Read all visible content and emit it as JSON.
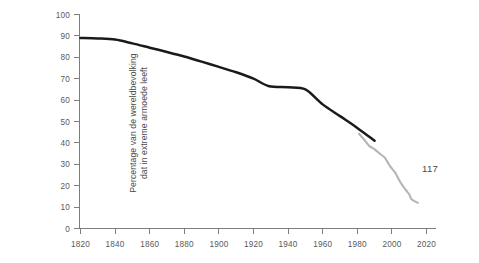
{
  "page": {
    "page_number": "117",
    "background_color": "#ffffff"
  },
  "axis_title": {
    "y_line1": "Percentage van de wereldbevolking",
    "y_line2": "dat in extreme armoede leeft"
  },
  "colors": {
    "historic_line": "#1a1a1a",
    "recent_line": "#b5b5b5",
    "axis": "#7d7d7d",
    "text": "#4a4a4a"
  },
  "chart_data": {
    "type": "line",
    "title": "",
    "xlabel": "",
    "ylabel": "Percentage van de wereldbevolking dat in extreme armoede leeft",
    "xlim": [
      1820,
      2020
    ],
    "ylim": [
      0,
      100
    ],
    "grid": false,
    "legend": "none",
    "xticks": [
      1820,
      1840,
      1860,
      1880,
      1900,
      1920,
      1940,
      1960,
      1980,
      2000,
      2020
    ],
    "xtick_labels": [
      "1820",
      "1840",
      "1860",
      "1880",
      "1900",
      "1920",
      "1940",
      "1960",
      "1980",
      "2000",
      "2020"
    ],
    "yticks": [
      0,
      10,
      20,
      30,
      40,
      50,
      60,
      70,
      80,
      90,
      100
    ],
    "ytick_labels": [
      "0",
      "10",
      "20",
      "30",
      "40",
      "50",
      "60",
      "70",
      "80",
      "90",
      "100"
    ],
    "series": [
      {
        "name": "Historische schatting",
        "color": "#1a1a1a",
        "x": [
          1820,
          1830,
          1840,
          1850,
          1860,
          1870,
          1880,
          1890,
          1900,
          1910,
          1920,
          1929,
          1940,
          1950,
          1960,
          1970,
          1980,
          1990
        ],
        "values": [
          89.0,
          88.8,
          88.3,
          86.5,
          84.5,
          82.5,
          80.4,
          78.0,
          75.5,
          73.0,
          70.0,
          66.5,
          66.0,
          65.0,
          58.0,
          52.5,
          47.0,
          41.0
        ]
      },
      {
        "name": "Recente meting",
        "color": "#b5b5b5",
        "x": [
          1981,
          1984,
          1987,
          1990,
          1993,
          1996,
          1999,
          2002,
          2005,
          2008,
          2010,
          2011,
          2013,
          2015
        ],
        "values": [
          44.3,
          41.5,
          38.5,
          37.0,
          35.0,
          33.0,
          29.0,
          26.0,
          21.5,
          18.0,
          16.0,
          14.0,
          12.8,
          12.0
        ]
      }
    ]
  }
}
